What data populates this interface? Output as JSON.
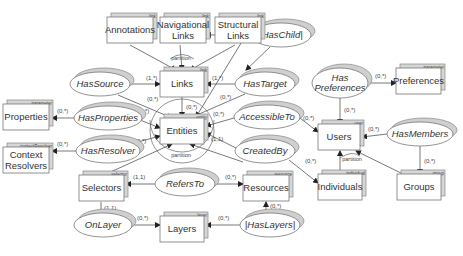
{
  "diagram": {
    "entities": [
      {
        "id": "annotations",
        "label": [
          "Annotations"
        ],
        "tag": "link",
        "x": 107,
        "y": 17,
        "w": 46,
        "h": 26
      },
      {
        "id": "navlinks",
        "label": [
          "Navigational",
          "Links"
        ],
        "tag": "link",
        "x": 160,
        "y": 17,
        "w": 46,
        "h": 26
      },
      {
        "id": "structlinks",
        "label": [
          "Structural",
          "Links"
        ],
        "tag": "link",
        "x": 215,
        "y": 17,
        "w": 46,
        "h": 26
      },
      {
        "id": "links",
        "label": [
          "Links"
        ],
        "tag": "link",
        "x": 160,
        "y": 71,
        "w": 44,
        "h": 26
      },
      {
        "id": "properties",
        "label": [
          "Properties"
        ],
        "tag": "parameter",
        "x": 3,
        "y": 104,
        "w": 46,
        "h": 26
      },
      {
        "id": "entities",
        "label": [
          "Entities"
        ],
        "tag": "entity",
        "x": 160,
        "y": 118,
        "w": 44,
        "h": 26
      },
      {
        "id": "contextresolvers",
        "label": [
          "Context",
          "Resolvers"
        ],
        "tag": "contextResolver",
        "x": 3,
        "y": 147,
        "w": 46,
        "h": 26
      },
      {
        "id": "selectors",
        "label": [
          "Selectors"
        ],
        "tag": "selector",
        "x": 79,
        "y": 175,
        "w": 45,
        "h": 26
      },
      {
        "id": "resources",
        "label": [
          "Resources"
        ],
        "tag": "resource",
        "x": 243,
        "y": 175,
        "w": 46,
        "h": 26
      },
      {
        "id": "layers",
        "label": [
          "Layers"
        ],
        "tag": "layer",
        "x": 160,
        "y": 216,
        "w": 44,
        "h": 26
      },
      {
        "id": "preferences",
        "label": [
          "Preferences"
        ],
        "tag": "parameter",
        "x": 396,
        "y": 68,
        "w": 45,
        "h": 26
      },
      {
        "id": "users",
        "label": [
          "Users"
        ],
        "tag": "user",
        "x": 318,
        "y": 124,
        "w": 42,
        "h": 26
      },
      {
        "id": "individuals",
        "label": [
          "Individuals"
        ],
        "tag": "individual",
        "x": 318,
        "y": 174,
        "w": 44,
        "h": 26
      },
      {
        "id": "groups",
        "label": [
          "Groups"
        ],
        "tag": "group",
        "x": 397,
        "y": 174,
        "w": 44,
        "h": 26
      }
    ],
    "relationships": [
      {
        "id": "haschild",
        "label": [
          "|HasChild|"
        ],
        "cx": 281,
        "cy": 35,
        "rx": 30,
        "ry": 12
      },
      {
        "id": "hassource",
        "label": [
          "HasSource"
        ],
        "cx": 100,
        "cy": 84,
        "rx": 30,
        "ry": 12
      },
      {
        "id": "hastarget",
        "label": [
          "HasTarget"
        ],
        "cx": 265,
        "cy": 84,
        "rx": 30,
        "ry": 12
      },
      {
        "id": "haspreferences",
        "label": [
          "Has",
          "Preferences"
        ],
        "cx": 340,
        "cy": 83,
        "rx": 28,
        "ry": 15
      },
      {
        "id": "hasproperties",
        "label": [
          "HasProperties"
        ],
        "cx": 108,
        "cy": 118,
        "rx": 34,
        "ry": 12
      },
      {
        "id": "accessibleto",
        "label": [
          "AccessibleTo"
        ],
        "cx": 267,
        "cy": 117,
        "rx": 33,
        "ry": 12
      },
      {
        "id": "hasresolver",
        "label": [
          "HasResolver"
        ],
        "cx": 108,
        "cy": 151,
        "rx": 32,
        "ry": 12
      },
      {
        "id": "createdby",
        "label": [
          "CreatedBy"
        ],
        "cx": 265,
        "cy": 151,
        "rx": 30,
        "ry": 12
      },
      {
        "id": "hasmembers",
        "label": [
          "HasMembers"
        ],
        "cx": 420,
        "cy": 134,
        "rx": 33,
        "ry": 12
      },
      {
        "id": "refersto",
        "label": [
          "RefersTo"
        ],
        "cx": 185,
        "cy": 184,
        "rx": 30,
        "ry": 12
      },
      {
        "id": "onlayer",
        "label": [
          "OnLayer"
        ],
        "cx": 103,
        "cy": 225,
        "rx": 29,
        "ry": 12
      },
      {
        "id": "haslayers",
        "label": [
          "|HasLayers|"
        ],
        "cx": 270,
        "cy": 225,
        "rx": 30,
        "ry": 12
      }
    ],
    "edges": [
      {
        "from": [
          130,
          45
        ],
        "to": [
          176,
          70
        ],
        "arrow": true
      },
      {
        "from": [
          180,
          45
        ],
        "to": [
          182,
          70
        ],
        "arrow": true
      },
      {
        "from": [
          235,
          45
        ],
        "to": [
          190,
          70
        ],
        "arrow": true
      },
      {
        "from": [
          250,
          35
        ],
        "to": [
          206,
          35
        ],
        "arrow": true,
        "card": "(1,*)",
        "cardAt": [
          240,
          30
        ]
      },
      {
        "from": [
          130,
          84
        ],
        "to": [
          160,
          84
        ],
        "arrow": true,
        "card": "(1,*)",
        "cardAt": [
          146,
          80
        ]
      },
      {
        "from": [
          235,
          84
        ],
        "to": [
          206,
          84
        ],
        "arrow": true,
        "card": "(1,*)",
        "cardAt": [
          212,
          80
        ]
      },
      {
        "from": [
          270,
          47
        ],
        "to": [
          246,
          70
        ],
        "arrow": true
      },
      {
        "from": [
          118,
          95
        ],
        "to": [
          172,
          118
        ],
        "arrow": true,
        "card": "(0,*)",
        "cardAt": [
          147,
          101
        ]
      },
      {
        "from": [
          182,
          97
        ],
        "to": [
          182,
          117
        ],
        "arrow": true,
        "card": "(0,*)",
        "cardAt": [
          186,
          109
        ]
      },
      {
        "from": [
          245,
          94
        ],
        "to": [
          190,
          118
        ],
        "arrow": true,
        "card": "(0,*)",
        "cardAt": [
          220,
          99
        ]
      },
      {
        "from": [
          246,
          35
        ],
        "to": [
          196,
          117
        ],
        "arrow": true
      },
      {
        "from": [
          74,
          118
        ],
        "to": [
          52,
          118
        ],
        "arrow": true,
        "card": "(0,*)",
        "cardAt": [
          57,
          113
        ]
      },
      {
        "from": [
          140,
          120
        ],
        "to": [
          160,
          128
        ],
        "arrow": true,
        "card": "(0,*)",
        "cardAt": [
          138,
          113
        ]
      },
      {
        "from": [
          234,
          118
        ],
        "to": [
          206,
          126
        ],
        "arrow": true,
        "card": "(0,*)",
        "cardAt": [
          213,
          116
        ]
      },
      {
        "from": [
          76,
          151
        ],
        "to": [
          52,
          151
        ],
        "arrow": true,
        "card": "(0,*)",
        "cardAt": [
          57,
          146
        ]
      },
      {
        "from": [
          134,
          143
        ],
        "to": [
          160,
          136
        ],
        "arrow": true,
        "card": "(0,*)",
        "cardAt": [
          135,
          143
        ]
      },
      {
        "from": [
          236,
          148
        ],
        "to": [
          206,
          133
        ],
        "arrow": true,
        "card": "(1,1)",
        "cardAt": [
          211,
          141
        ]
      },
      {
        "from": [
          104,
          175
        ],
        "to": [
          172,
          144
        ],
        "arrow": true
      },
      {
        "from": [
          300,
          118
        ],
        "to": [
          318,
          132
        ],
        "arrow": true,
        "card": "(0,*)",
        "cardAt": [
          303,
          120
        ]
      },
      {
        "from": [
          289,
          160
        ],
        "to": [
          318,
          183
        ],
        "arrow": true,
        "card": "(0,*)",
        "cardAt": [
          305,
          163
        ]
      },
      {
        "from": [
          243,
          162
        ],
        "to": [
          190,
          144
        ],
        "arrow": true
      },
      {
        "from": [
          368,
          83
        ],
        "to": [
          396,
          83
        ],
        "arrow": true,
        "card": "(0,*)",
        "cardAt": [
          375,
          78
        ]
      },
      {
        "from": [
          340,
          98
        ],
        "to": [
          340,
          124
        ],
        "arrow": true,
        "card": "(0,*)",
        "cardAt": [
          344,
          112
        ]
      },
      {
        "from": [
          387,
          134
        ],
        "to": [
          362,
          137
        ],
        "arrow": true,
        "card": "(0,*)",
        "cardAt": [
          368,
          131
        ]
      },
      {
        "from": [
          420,
          146
        ],
        "to": [
          420,
          174
        ],
        "arrow": true,
        "card": "(0,*)",
        "cardAt": [
          424,
          163
        ]
      },
      {
        "from": [
          340,
          174
        ],
        "to": [
          340,
          151
        ],
        "arrow": true
      },
      {
        "from": [
          403,
          174
        ],
        "to": [
          356,
          151
        ],
        "arrow": true
      },
      {
        "from": [
          155,
          184
        ],
        "to": [
          126,
          184
        ],
        "arrow": true,
        "card": "(1,1)",
        "cardAt": [
          133,
          179
        ]
      },
      {
        "from": [
          215,
          184
        ],
        "to": [
          243,
          184
        ],
        "arrow": true,
        "card": "(0,*)",
        "cardAt": [
          225,
          179
        ]
      },
      {
        "from": [
          101,
          202
        ],
        "to": [
          101,
          213
        ],
        "arrow": false,
        "card": "(1,1)",
        "cardAt": [
          104,
          210
        ]
      },
      {
        "from": [
          132,
          225
        ],
        "to": [
          160,
          225
        ],
        "arrow": true,
        "card": "(0,*)",
        "cardAt": [
          137,
          220
        ]
      },
      {
        "from": [
          240,
          225
        ],
        "to": [
          206,
          225
        ],
        "arrow": true,
        "card": "(0,*)",
        "cardAt": [
          218,
          220
        ]
      },
      {
        "from": [
          266,
          213
        ],
        "to": [
          266,
          202
        ],
        "arrow": true,
        "card": "(0,*)",
        "cardAt": [
          270,
          208
        ]
      }
    ],
    "partitions": [
      {
        "label": "partition",
        "x": 181,
        "y": 60,
        "arc": "M 170 59 Q 182 50 194 59"
      },
      {
        "label": "partition",
        "x": 181,
        "y": 157,
        "arc": "M 150 120 A 30 30 0 0 0 214 120"
      },
      {
        "label": "partition",
        "x": 352,
        "y": 161,
        "arc": "M 340 158 Q 352 150 360 156"
      }
    ],
    "entities_circle": {
      "cx": 182,
      "cy": 131,
      "r": 32
    }
  }
}
